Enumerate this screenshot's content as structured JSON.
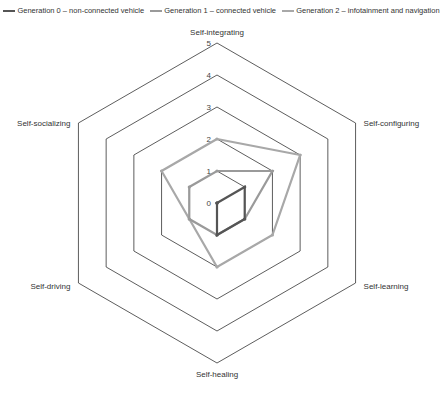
{
  "chart_data": {
    "type": "radar",
    "title": "",
    "categories": [
      "Self-integrating",
      "Self-configuring",
      "Self-learning",
      "Self-healing",
      "Self-driving",
      "Self-socializing"
    ],
    "rlim": [
      0,
      5
    ],
    "ticks": [
      "0",
      "1",
      "2",
      "3",
      "4",
      "5"
    ],
    "series": [
      {
        "name": "Generation 0 – non-connected vehicle",
        "values": [
          0,
          1,
          1,
          1,
          0,
          0
        ],
        "color": "#555555"
      },
      {
        "name": "Generation 1 – connected vehicle",
        "values": [
          1,
          2,
          1,
          1,
          1,
          1
        ],
        "color": "#9a9a9a"
      },
      {
        "name": "Generation 2 – infotainment and navigation",
        "values": [
          2,
          3,
          2,
          2,
          1,
          2
        ],
        "color": "#a8a8a8"
      }
    ],
    "legend_position": "top"
  }
}
